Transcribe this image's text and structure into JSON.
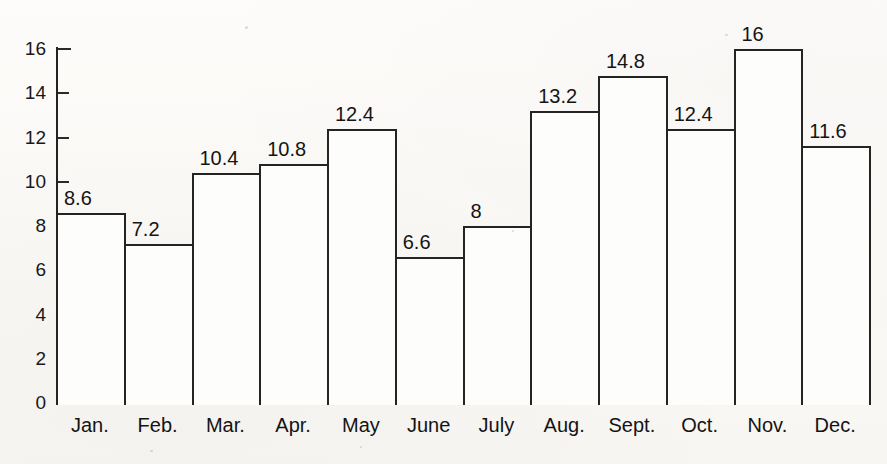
{
  "chart_data": {
    "type": "bar",
    "title": "",
    "subtitle": "",
    "xlabel": "",
    "ylabel": "",
    "categories": [
      "Jan.",
      "Feb.",
      "Mar.",
      "Apr.",
      "May",
      "June",
      "July",
      "Aug.",
      "Sept.",
      "Oct.",
      "Nov.",
      "Dec."
    ],
    "values": [
      8.6,
      7.2,
      10.4,
      10.8,
      12.4,
      6.6,
      8,
      13.2,
      14.8,
      12.4,
      16,
      11.6
    ],
    "data_labels": [
      "8.6",
      "7.2",
      "10.4",
      "10.8",
      "12.4",
      "6.6",
      "8",
      "13.2",
      "14.8",
      "12.4",
      "16",
      "11.6"
    ],
    "ylim": [
      0,
      16
    ],
    "yticks": [
      0,
      2,
      4,
      6,
      8,
      10,
      12,
      14,
      16
    ],
    "ytick_labels": [
      "0",
      "2",
      "4",
      "6",
      "8",
      "10",
      "12",
      "14",
      "16"
    ],
    "grid": false,
    "legend": null,
    "legend_position": "none",
    "bar_fill": "#fdfdfb",
    "bar_edge": "#242424",
    "axis_color": "#232323",
    "text_color": "#141414",
    "background": "#fbfaf8",
    "bars_adjacent": true,
    "data_label_position": "above-left-of-bar-top"
  },
  "axis": {
    "y_ticks": [
      {
        "label": "16",
        "value": 16
      },
      {
        "label": "14",
        "value": 14
      },
      {
        "label": "12",
        "value": 12
      },
      {
        "label": "10",
        "value": 10
      },
      {
        "label": "8",
        "value": 8
      },
      {
        "label": "6",
        "value": 6
      },
      {
        "label": "4",
        "value": 4
      },
      {
        "label": "2",
        "value": 2
      },
      {
        "label": "0",
        "value": 0
      }
    ]
  }
}
